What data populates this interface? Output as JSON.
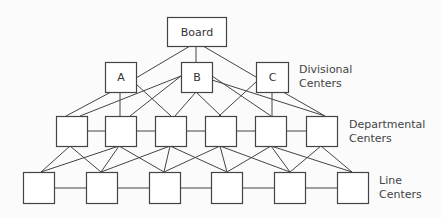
{
  "levels": {
    "board": {
      "label": "Board"
    },
    "divisional": {
      "label_line1": "Divisional",
      "label_line2": "Centers",
      "nodes": [
        "A",
        "B",
        "C"
      ]
    },
    "departmental": {
      "label_line1": "Departmental",
      "label_line2": "Centers",
      "count": 6
    },
    "line": {
      "label_line1": "Line",
      "label_line2": "Centers",
      "count": 6
    }
  },
  "nodes": [
    {
      "id": "board",
      "label": "Board",
      "x": 167,
      "y": 17,
      "w": 59,
      "h": 29
    },
    {
      "id": "A",
      "label": "A",
      "x": 105,
      "y": 62,
      "w": 31,
      "h": 30
    },
    {
      "id": "B",
      "label": "B",
      "x": 181,
      "y": 62,
      "w": 31,
      "h": 30
    },
    {
      "id": "C",
      "label": "C",
      "x": 256,
      "y": 62,
      "w": 32,
      "h": 30
    },
    {
      "id": "D1",
      "label": "",
      "x": 56,
      "y": 116,
      "w": 31,
      "h": 30
    },
    {
      "id": "D2",
      "label": "",
      "x": 105,
      "y": 116,
      "w": 31,
      "h": 30
    },
    {
      "id": "D3",
      "label": "",
      "x": 155,
      "y": 116,
      "w": 31,
      "h": 30
    },
    {
      "id": "D4",
      "label": "",
      "x": 205,
      "y": 116,
      "w": 31,
      "h": 30
    },
    {
      "id": "D5",
      "label": "",
      "x": 255,
      "y": 116,
      "w": 31,
      "h": 30
    },
    {
      "id": "D6",
      "label": "",
      "x": 306,
      "y": 116,
      "w": 31,
      "h": 30
    },
    {
      "id": "L1",
      "label": "",
      "x": 23,
      "y": 172,
      "w": 31,
      "h": 31
    },
    {
      "id": "L2",
      "label": "",
      "x": 86,
      "y": 172,
      "w": 31,
      "h": 31
    },
    {
      "id": "L3",
      "label": "",
      "x": 149,
      "y": 172,
      "w": 31,
      "h": 31
    },
    {
      "id": "L4",
      "label": "",
      "x": 211,
      "y": 172,
      "w": 31,
      "h": 31
    },
    {
      "id": "L5",
      "label": "",
      "x": 274,
      "y": 172,
      "w": 31,
      "h": 31
    },
    {
      "id": "L6",
      "label": "",
      "x": 337,
      "y": 172,
      "w": 31,
      "h": 31
    }
  ],
  "edges": [
    {
      "x1": 190,
      "y1": 46,
      "x2": 136,
      "y2": 78
    },
    {
      "x1": 196,
      "y1": 46,
      "x2": 196,
      "y2": 62
    },
    {
      "x1": 203,
      "y1": 46,
      "x2": 256,
      "y2": 77
    },
    {
      "x1": 111,
      "y1": 92,
      "x2": 66,
      "y2": 116
    },
    {
      "x1": 120,
      "y1": 92,
      "x2": 120,
      "y2": 116
    },
    {
      "x1": 136,
      "y1": 84,
      "x2": 171,
      "y2": 116
    },
    {
      "x1": 181,
      "y1": 76,
      "x2": 80,
      "y2": 116
    },
    {
      "x1": 181,
      "y1": 76,
      "x2": 130,
      "y2": 116
    },
    {
      "x1": 196,
      "y1": 92,
      "x2": 175,
      "y2": 116
    },
    {
      "x1": 196,
      "y1": 92,
      "x2": 221,
      "y2": 116
    },
    {
      "x1": 212,
      "y1": 76,
      "x2": 271,
      "y2": 116
    },
    {
      "x1": 212,
      "y1": 80,
      "x2": 325,
      "y2": 116
    },
    {
      "x1": 256,
      "y1": 82,
      "x2": 219,
      "y2": 116
    },
    {
      "x1": 272,
      "y1": 92,
      "x2": 272,
      "y2": 116
    },
    {
      "x1": 283,
      "y1": 92,
      "x2": 325,
      "y2": 116
    },
    {
      "x1": 87,
      "y1": 131,
      "x2": 105,
      "y2": 131
    },
    {
      "x1": 136,
      "y1": 131,
      "x2": 155,
      "y2": 131
    },
    {
      "x1": 186,
      "y1": 131,
      "x2": 205,
      "y2": 131
    },
    {
      "x1": 236,
      "y1": 131,
      "x2": 255,
      "y2": 131
    },
    {
      "x1": 286,
      "y1": 131,
      "x2": 306,
      "y2": 131
    },
    {
      "x1": 70,
      "y1": 146,
      "x2": 41,
      "y2": 172
    },
    {
      "x1": 70,
      "y1": 146,
      "x2": 101,
      "y2": 172
    },
    {
      "x1": 119,
      "y1": 146,
      "x2": 41,
      "y2": 172
    },
    {
      "x1": 119,
      "y1": 146,
      "x2": 101,
      "y2": 172
    },
    {
      "x1": 119,
      "y1": 146,
      "x2": 164,
      "y2": 172
    },
    {
      "x1": 170,
      "y1": 146,
      "x2": 101,
      "y2": 172
    },
    {
      "x1": 170,
      "y1": 146,
      "x2": 164,
      "y2": 172
    },
    {
      "x1": 170,
      "y1": 146,
      "x2": 227,
      "y2": 172
    },
    {
      "x1": 220,
      "y1": 146,
      "x2": 164,
      "y2": 172
    },
    {
      "x1": 220,
      "y1": 146,
      "x2": 227,
      "y2": 172
    },
    {
      "x1": 220,
      "y1": 146,
      "x2": 290,
      "y2": 172
    },
    {
      "x1": 271,
      "y1": 146,
      "x2": 227,
      "y2": 172
    },
    {
      "x1": 271,
      "y1": 146,
      "x2": 290,
      "y2": 172
    },
    {
      "x1": 271,
      "y1": 146,
      "x2": 352,
      "y2": 172
    },
    {
      "x1": 321,
      "y1": 146,
      "x2": 290,
      "y2": 172
    },
    {
      "x1": 321,
      "y1": 146,
      "x2": 352,
      "y2": 172
    },
    {
      "x1": 54,
      "y1": 188,
      "x2": 86,
      "y2": 188
    },
    {
      "x1": 117,
      "y1": 188,
      "x2": 149,
      "y2": 188
    },
    {
      "x1": 180,
      "y1": 188,
      "x2": 211,
      "y2": 188
    },
    {
      "x1": 242,
      "y1": 188,
      "x2": 274,
      "y2": 188
    },
    {
      "x1": 305,
      "y1": 188,
      "x2": 337,
      "y2": 188
    }
  ]
}
